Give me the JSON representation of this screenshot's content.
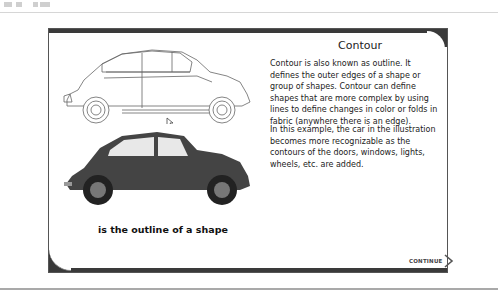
{
  "slide": {
    "title": "Contour",
    "paragraphs": [
      "Contour is also known as outline. It defines the outer edges of a shape or group of shapes. Contour can define shapes that are more complex by using lines to define changes in color or folds in fabric (anywhere there is an edge).",
      "In this example, the car in the illustration becomes more recognizable as the contours of the doors, windows, lights, wheels, etc. are added."
    ],
    "caption": "is the outline of a shape",
    "continue_label": "CONTINUE"
  },
  "images": {
    "outline_car": "car-outline-drawing",
    "photo_car": "car-photo"
  }
}
